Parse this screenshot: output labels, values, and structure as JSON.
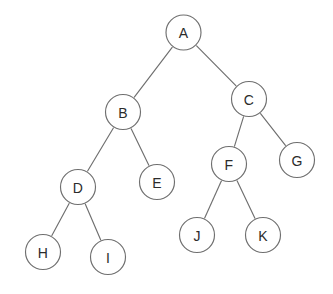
{
  "diagram": {
    "type": "binary-tree",
    "canvas": {
      "width": 333,
      "height": 294,
      "background": "#ffffff"
    },
    "style": {
      "node_fill": "#ffffff",
      "node_stroke": "#6f6f6f",
      "edge_stroke": "#6f6f6f",
      "label_color": "#2b2b2b",
      "stroke_width": 1.15,
      "node_radius": 17.5
    },
    "root": "A",
    "nodes": [
      {
        "id": "A",
        "label": "A",
        "cx": 183.5,
        "cy": 32.5,
        "r": 17.5,
        "depth": 0
      },
      {
        "id": "B",
        "label": "B",
        "cx": 123.0,
        "cy": 112.0,
        "r": 17.5,
        "depth": 1
      },
      {
        "id": "C",
        "label": "C",
        "cx": 249.0,
        "cy": 99.0,
        "r": 17.5,
        "depth": 1
      },
      {
        "id": "D",
        "label": "D",
        "cx": 78.0,
        "cy": 187.0,
        "r": 17.5,
        "depth": 2
      },
      {
        "id": "E",
        "label": "E",
        "cx": 157.0,
        "cy": 182.0,
        "r": 17.5,
        "depth": 2
      },
      {
        "id": "F",
        "label": "F",
        "cx": 229.0,
        "cy": 164.0,
        "r": 17.5,
        "depth": 2
      },
      {
        "id": "G",
        "label": "G",
        "cx": 297.0,
        "cy": 160.0,
        "r": 17.5,
        "depth": 2
      },
      {
        "id": "H",
        "label": "H",
        "cx": 43.0,
        "cy": 252.0,
        "r": 17.5,
        "depth": 3
      },
      {
        "id": "I",
        "label": "I",
        "cx": 108.0,
        "cy": 257.0,
        "r": 17.5,
        "depth": 3
      },
      {
        "id": "J",
        "label": "J",
        "cx": 197.0,
        "cy": 235.0,
        "r": 17.5,
        "depth": 3
      },
      {
        "id": "K",
        "label": "K",
        "cx": 263.0,
        "cy": 235.0,
        "r": 17.5,
        "depth": 3
      }
    ],
    "edges": [
      {
        "from": "A",
        "to": "B",
        "side": "left"
      },
      {
        "from": "A",
        "to": "C",
        "side": "right"
      },
      {
        "from": "B",
        "to": "D",
        "side": "left"
      },
      {
        "from": "B",
        "to": "E",
        "side": "right"
      },
      {
        "from": "C",
        "to": "F",
        "side": "left"
      },
      {
        "from": "C",
        "to": "G",
        "side": "right"
      },
      {
        "from": "D",
        "to": "H",
        "side": "left"
      },
      {
        "from": "D",
        "to": "I",
        "side": "right"
      },
      {
        "from": "F",
        "to": "J",
        "side": "left"
      },
      {
        "from": "F",
        "to": "K",
        "side": "right"
      }
    ]
  }
}
